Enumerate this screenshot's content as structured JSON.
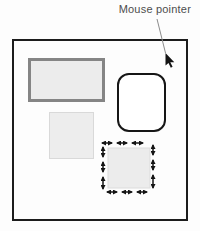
{
  "figure": {
    "annotation": {
      "label": "Mouse pointer"
    },
    "pointer": {
      "icon": "mouse-pointer-icon",
      "color": "#141414"
    },
    "canvas": {
      "border_color": "#1c1c1c",
      "background": "#fdfdfd",
      "shapes": [
        {
          "name": "thick-border-rectangle",
          "fill": "#ececec",
          "border": "#858585"
        },
        {
          "name": "rounded-rectangle",
          "fill": "#ffffff",
          "border": "#161616"
        },
        {
          "name": "plain-square",
          "fill": "#ededed",
          "border": "#d9d9d9"
        },
        {
          "name": "move-arrows-square",
          "fill": "#ececec",
          "border": "#dcdcdc",
          "arrow_color": "#141414",
          "arrow_icon": "double-headed-arrow-icon"
        }
      ]
    },
    "colors": {
      "label_text": "#4d4d4d",
      "leader_line": "#8c8c8c"
    }
  }
}
